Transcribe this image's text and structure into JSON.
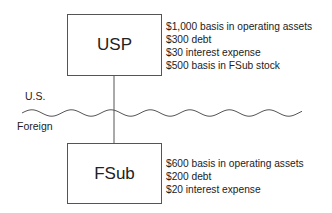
{
  "entities": {
    "parent": {
      "name": "USP",
      "facts": [
        "$1,000 basis in operating assets",
        "$300 debt",
        "$30 interest expense",
        "$500 basis in FSub stock"
      ]
    },
    "subsidiary": {
      "name": "FSub",
      "facts": [
        "$600 basis in operating assets",
        "$200 debt",
        "$20 interest expense"
      ]
    }
  },
  "border": {
    "upper_label": "U.S.",
    "lower_label": "Foreign"
  },
  "colors": {
    "line": "#555555",
    "text": "#222222"
  }
}
